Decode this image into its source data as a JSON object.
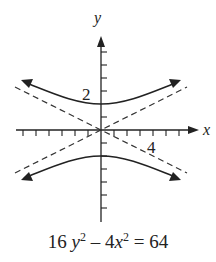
{
  "diagram": {
    "type": "hyperbola-graph",
    "equation": {
      "a": "16",
      "v1": "y",
      "e1": "2",
      "op": "–",
      "b": "4",
      "v2": "x",
      "e2": "2",
      "eq": "=",
      "rhs": "64"
    },
    "axes": {
      "x_label": "x",
      "y_label": "y",
      "x_tick_label": "4",
      "y_tick_label": "2"
    },
    "colors": {
      "curve": "#222222",
      "asymptote": "#333333",
      "axis": "#222222"
    }
  }
}
